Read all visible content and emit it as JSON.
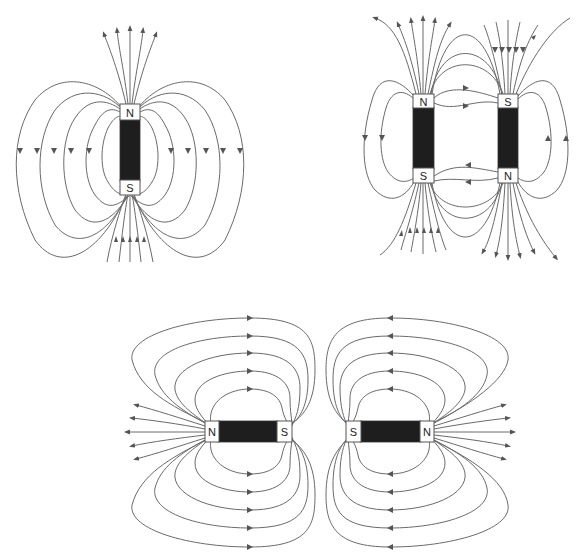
{
  "diagram": {
    "type": "magnetic-field-lines",
    "colors": {
      "magnet_body": "#1e1e1e",
      "field_line": "#6a6a6a",
      "pole_box": "#ffffff"
    },
    "panels": [
      {
        "id": "single-bar-magnet",
        "orientation": "vertical",
        "magnets": [
          {
            "top_pole": "N",
            "bottom_pole": "S"
          }
        ]
      },
      {
        "id": "two-antiparallel-magnets",
        "orientation": "vertical",
        "magnets": [
          {
            "top_pole": "N",
            "bottom_pole": "S"
          },
          {
            "top_pole": "S",
            "bottom_pole": "N"
          }
        ]
      },
      {
        "id": "two-repelling-horizontal-magnets",
        "orientation": "horizontal",
        "magnets": [
          {
            "left_pole": "N",
            "right_pole": "S"
          },
          {
            "left_pole": "S",
            "right_pole": "N"
          }
        ]
      }
    ]
  }
}
